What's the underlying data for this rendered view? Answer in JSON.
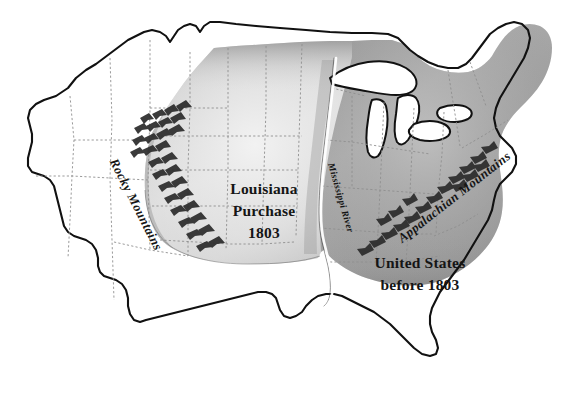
{
  "map": {
    "title": "Louisiana Purchase 1803 map of the United States",
    "background_color": "#ffffff",
    "outline_color": "#111111",
    "state_border_color": "#8e8e8e",
    "labels": {
      "louisiana_purchase": {
        "line1": "Louisiana",
        "line2": "Purchase",
        "line3": "1803"
      },
      "united_states_before": {
        "line1": "United States",
        "line2": "before 1803"
      },
      "rocky_mountains": "Rocky Mountains",
      "appalachian_mountains": "Appalachian Mountains",
      "mississippi_river": "Mississippi River"
    },
    "regions": [
      {
        "name": "louisiana-purchase",
        "label": "Louisiana Purchase 1803",
        "fill_color": "#d9d9d9",
        "shaded": true
      },
      {
        "name": "united-states-before-1803",
        "label": "United States before 1803",
        "fill_color": "#a3a3a3",
        "shaded": true
      },
      {
        "name": "unshaded-western-territory",
        "label": "",
        "fill_color": "#ffffff",
        "shaded": false
      }
    ],
    "features": [
      {
        "name": "rocky-mountains",
        "type": "mountain-range"
      },
      {
        "name": "appalachian-mountains",
        "type": "mountain-range"
      },
      {
        "name": "mississippi-river",
        "type": "river"
      },
      {
        "name": "great-lakes",
        "type": "lakes"
      }
    ]
  }
}
